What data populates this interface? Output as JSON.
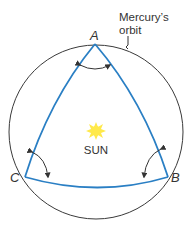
{
  "diagram": {
    "orbit_label_line1": "Mercury’s",
    "orbit_label_line2": "orbit",
    "vertex_a": "A",
    "vertex_b": "B",
    "vertex_c": "C",
    "sun_label": "SUN",
    "colors": {
      "orbit": "#3a3a3a",
      "triangle": "#2a7fc4",
      "sun": "#ffe94a",
      "text": "#333333",
      "arrows": "#333333"
    }
  }
}
